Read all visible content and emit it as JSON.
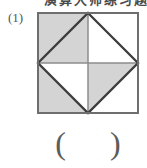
{
  "page": {
    "background_color": "#ffffff",
    "width": 147,
    "height": 168
  },
  "header": {
    "clipped_text": "演算大师练习题"
  },
  "item": {
    "number_label": "(1)",
    "answer_open_paren": "(",
    "answer_close_paren": ")",
    "answer_value": ""
  },
  "figure": {
    "name": "square-with-inscribed-diamond-shaded-fraction",
    "outer_square": {
      "stroke_color": "#6e6e6e",
      "stroke_width": 2,
      "fill_color": "#ffffff",
      "size": 100
    },
    "inscribed_diamond": {
      "stroke_color": "#3a3a3a",
      "stroke_width": 2.2,
      "description": "square rotated 45 degrees joining the midpoints of the outer square's sides"
    },
    "center_lines": {
      "stroke_color": "#8a8a8a",
      "stroke_width": 1.4,
      "description": "vertical and horizontal lines through the centre of the square"
    },
    "shaded_fill_color": "#d4d4d4",
    "unshaded_fill_color": "#ffffff",
    "total_regions": 8,
    "shaded_regions": 4,
    "shaded_region_names": [
      "inner-triangle-top-left",
      "outer-triangle-left-upper",
      "outer-triangle-left-lower",
      "inner-triangle-bottom-right"
    ],
    "shaded_fraction_text": "4/8"
  }
}
